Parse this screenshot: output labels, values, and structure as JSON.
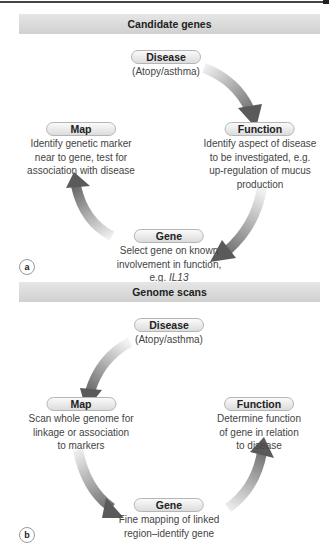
{
  "panels": [
    {
      "id": "a",
      "title": "Candidate genes",
      "label": "a",
      "nodes": {
        "disease": {
          "title": "Disease",
          "lines": [
            "(Atopy/asthma)"
          ]
        },
        "function": {
          "title": "Function",
          "lines": [
            "Identify aspect of disease",
            "to be investigated, e.g.",
            "up-regulation of mucus",
            "production"
          ]
        },
        "gene": {
          "title": "Gene",
          "lines": [
            "Select gene on known",
            "involvement in function,"
          ],
          "last_prefix": "e.g. ",
          "last_italic": "IL13"
        },
        "map": {
          "title": "Map",
          "lines": [
            "Identify genetic marker",
            "near to gene, test for",
            "association with disease"
          ]
        }
      },
      "flow": [
        "Disease",
        "Function",
        "Gene",
        "Map"
      ]
    },
    {
      "id": "b",
      "title": "Genome scans",
      "label": "b",
      "nodes": {
        "disease": {
          "title": "Disease",
          "lines": [
            "(Atopy/asthma)"
          ]
        },
        "map": {
          "title": "Map",
          "lines": [
            "Scan whole genome for",
            "linkage or association",
            "to markers"
          ]
        },
        "gene": {
          "title": "Gene",
          "lines": [
            "Fine mapping of linked",
            "region–identify gene"
          ]
        },
        "function": {
          "title": "Function",
          "lines": [
            "Determine function",
            "of gene in relation",
            "to disease"
          ]
        }
      },
      "flow": [
        "Disease",
        "Map",
        "Gene",
        "Function"
      ]
    }
  ],
  "colors": {
    "arrow_dark": "#5a5a5a",
    "arrow_light": "#f0f0f0",
    "banner": "#d8d8d8",
    "pill": "#e6e6e6"
  }
}
